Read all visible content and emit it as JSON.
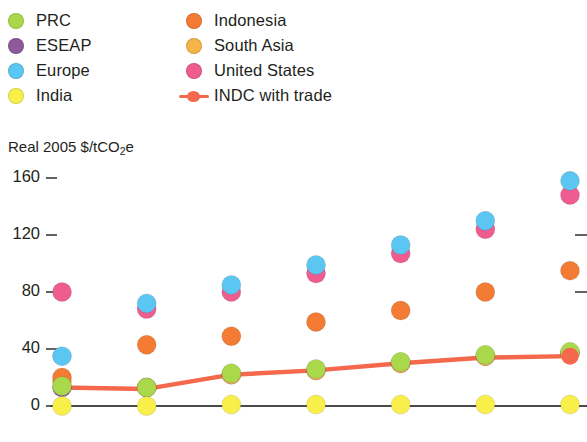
{
  "legend": {
    "columns": [
      {
        "items": [
          {
            "label": "PRC",
            "color": "#a9d94b",
            "marker": "dot"
          },
          {
            "label": "ESEAP",
            "color": "#8e5b9a",
            "marker": "dot"
          },
          {
            "label": "Europe",
            "color": "#5cc6f2",
            "marker": "dot"
          },
          {
            "label": "India",
            "color": "#f9ef4b",
            "marker": "dot"
          }
        ]
      },
      {
        "items": [
          {
            "label": "Indonesia",
            "color": "#f47b34",
            "marker": "dot"
          },
          {
            "label": "South Asia",
            "color": "#f6b44a",
            "marker": "dot"
          },
          {
            "label": "United States",
            "color": "#ee5c90",
            "marker": "dot"
          },
          {
            "label": "INDC with trade",
            "color": "#f4684b",
            "marker": "line"
          }
        ]
      }
    ]
  },
  "axis_title": {
    "prefix": "Real 2005 $/tCO",
    "sub": "2",
    "suffix": "e"
  },
  "chart_data": {
    "type": "scatter",
    "title": "",
    "subtitle": "",
    "xlabel": "",
    "ylabel": "Real 2005 $/tCO2e",
    "x": [
      2020,
      2025,
      2030,
      2035,
      2040,
      2045,
      2050
    ],
    "xtick_labels": [
      "2020",
      "2025",
      "2030",
      "2035",
      "2040",
      "2045",
      "2050"
    ],
    "ytick_labels": [
      "0",
      "40",
      "80",
      "120",
      "160"
    ],
    "yticks": [
      0,
      40,
      80,
      120,
      160
    ],
    "ylim": [
      0,
      170
    ],
    "xlim": [
      2018.5,
      2051.5
    ],
    "grid": false,
    "legend_position": "top",
    "series": [
      {
        "name": "PRC",
        "color": "#a9d94b",
        "marker": "dot",
        "values": [
          14,
          13,
          23,
          26,
          31,
          36,
          38
        ]
      },
      {
        "name": "ESEAP",
        "color": "#8e5b9a",
        "marker": "dot",
        "values": [
          13,
          13,
          22,
          25,
          30,
          35,
          37
        ]
      },
      {
        "name": "Europe",
        "color": "#5cc6f2",
        "marker": "dot",
        "values": [
          35,
          72,
          85,
          99,
          113,
          130,
          158
        ]
      },
      {
        "name": "India",
        "color": "#f9ef4b",
        "marker": "dot",
        "values": [
          0,
          0,
          1,
          1,
          1,
          1,
          1
        ]
      },
      {
        "name": "Indonesia",
        "color": "#f47b34",
        "marker": "dot",
        "values": [
          20,
          43,
          49,
          59,
          67,
          80,
          95
        ]
      },
      {
        "name": "South Asia",
        "color": "#f6b44a",
        "marker": "dot",
        "values": [
          17,
          13,
          22,
          25,
          30,
          35,
          37
        ]
      },
      {
        "name": "United States",
        "color": "#ee5c90",
        "marker": "dot",
        "values": [
          80,
          68,
          80,
          93,
          107,
          124,
          148
        ]
      },
      {
        "name": "INDC with trade",
        "color": "#f4684b",
        "marker": "line",
        "values": [
          13,
          12,
          22,
          25,
          30,
          34,
          35
        ]
      }
    ]
  }
}
